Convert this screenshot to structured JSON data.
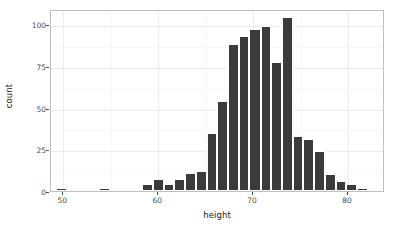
{
  "chart_data": {
    "type": "bar",
    "subtype": "histogram",
    "title": "",
    "xlabel": "height",
    "ylabel": "count",
    "xlim": [
      48.7,
      83.9
    ],
    "ylim": [
      0,
      109
    ],
    "xticks": [
      50,
      60,
      70,
      80
    ],
    "yticks": [
      0,
      25,
      50,
      75,
      100
    ],
    "xtick_labels": [
      "50",
      "60",
      "70",
      "80"
    ],
    "ytick_labels": [
      "0",
      "25",
      "50",
      "75",
      "100"
    ],
    "grid": true,
    "legend": "none",
    "bin_width": 1.15,
    "bar_color": "#3b3b3b",
    "bar_border_color": "#ffffff",
    "panel_border_color": "#bfbfbf",
    "grid_color": "#ebebeb",
    "bins": [
      {
        "x_center": 49.8,
        "x_left": 49.2,
        "x_right": 50.4,
        "count": 2
      },
      {
        "x_center": 50.9,
        "x_left": 50.4,
        "x_right": 51.5,
        "count": 0
      },
      {
        "x_center": 52.1,
        "x_left": 51.5,
        "x_right": 52.6,
        "count": 0
      },
      {
        "x_center": 53.2,
        "x_left": 52.6,
        "x_right": 53.8,
        "count": 0
      },
      {
        "x_center": 54.3,
        "x_left": 53.8,
        "x_right": 54.9,
        "count": 2
      },
      {
        "x_center": 55.5,
        "x_left": 54.9,
        "x_right": 56.0,
        "count": 0
      },
      {
        "x_center": 56.6,
        "x_left": 56.0,
        "x_right": 57.2,
        "count": 0
      },
      {
        "x_center": 57.7,
        "x_left": 57.2,
        "x_right": 58.3,
        "count": 1
      },
      {
        "x_center": 58.9,
        "x_left": 58.3,
        "x_right": 59.4,
        "count": 4
      },
      {
        "x_center": 60.0,
        "x_left": 59.4,
        "x_right": 60.6,
        "count": 7
      },
      {
        "x_center": 61.1,
        "x_left": 60.6,
        "x_right": 61.7,
        "count": 4
      },
      {
        "x_center": 62.3,
        "x_left": 61.7,
        "x_right": 62.8,
        "count": 7
      },
      {
        "x_center": 63.4,
        "x_left": 62.8,
        "x_right": 64.0,
        "count": 11
      },
      {
        "x_center": 64.5,
        "x_left": 64.0,
        "x_right": 65.1,
        "count": 12
      },
      {
        "x_center": 65.7,
        "x_left": 65.1,
        "x_right": 66.2,
        "count": 35
      },
      {
        "x_center": 66.8,
        "x_left": 66.2,
        "x_right": 67.4,
        "count": 54
      },
      {
        "x_center": 67.9,
        "x_left": 67.4,
        "x_right": 68.5,
        "count": 88
      },
      {
        "x_center": 69.1,
        "x_left": 68.5,
        "x_right": 69.6,
        "count": 93
      },
      {
        "x_center": 70.2,
        "x_left": 69.6,
        "x_right": 70.8,
        "count": 97
      },
      {
        "x_center": 71.3,
        "x_left": 70.8,
        "x_right": 71.9,
        "count": 99
      },
      {
        "x_center": 72.5,
        "x_left": 71.9,
        "x_right": 73.0,
        "count": 77
      },
      {
        "x_center": 73.6,
        "x_left": 73.0,
        "x_right": 74.2,
        "count": 104
      },
      {
        "x_center": 74.7,
        "x_left": 74.2,
        "x_right": 75.3,
        "count": 33
      },
      {
        "x_center": 75.9,
        "x_left": 75.3,
        "x_right": 76.4,
        "count": 31
      },
      {
        "x_center": 77.0,
        "x_left": 76.4,
        "x_right": 77.6,
        "count": 24
      },
      {
        "x_center": 78.1,
        "x_left": 77.6,
        "x_right": 78.7,
        "count": 10
      },
      {
        "x_center": 79.3,
        "x_left": 78.7,
        "x_right": 79.8,
        "count": 6
      },
      {
        "x_center": 80.4,
        "x_left": 79.8,
        "x_right": 81.0,
        "count": 4
      },
      {
        "x_center": 81.5,
        "x_left": 81.0,
        "x_right": 82.1,
        "count": 2
      },
      {
        "x_center": 82.7,
        "x_left": 82.1,
        "x_right": 83.2,
        "count": 0
      },
      {
        "x_center": 83.4,
        "x_left": 82.8,
        "x_right": 83.9,
        "count": 1
      }
    ]
  }
}
